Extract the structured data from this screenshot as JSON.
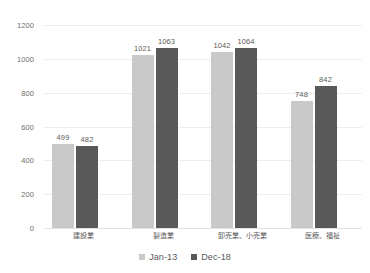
{
  "chart_data": {
    "type": "bar",
    "title": "",
    "subtitle": "",
    "xlabel": "",
    "ylabel": "",
    "ylim": [
      0,
      1200
    ],
    "y_ticks": [
      "0",
      "200",
      "400",
      "600",
      "800",
      "1000",
      "1200"
    ],
    "y_tick_values": [
      0,
      200,
      400,
      600,
      800,
      1000,
      1200
    ],
    "grid": true,
    "legend_position": "bottom",
    "categories": [
      "建設業",
      "製造業",
      "卸売業、小売業",
      "医療、福祉"
    ],
    "series": [
      {
        "name": "Jan-13",
        "color": "#c9c9c9",
        "values": [
          499,
          1021,
          1042,
          748
        ],
        "labels": [
          "499",
          "1021",
          "1042",
          "748"
        ]
      },
      {
        "name": "Dec-18",
        "color": "#595959",
        "values": [
          482,
          1063,
          1064,
          842
        ],
        "labels": [
          "482",
          "1063",
          "1064",
          "842"
        ]
      }
    ]
  },
  "legend": {
    "items": [
      {
        "label": "Jan-13",
        "color": "#c9c9c9"
      },
      {
        "label": "Dec-18",
        "color": "#595959"
      }
    ]
  },
  "colors": {
    "series_light": "#c9c9c9",
    "series_dark": "#595959",
    "gridline": "#ededed",
    "text": "#595959",
    "background": "#ffffff"
  }
}
